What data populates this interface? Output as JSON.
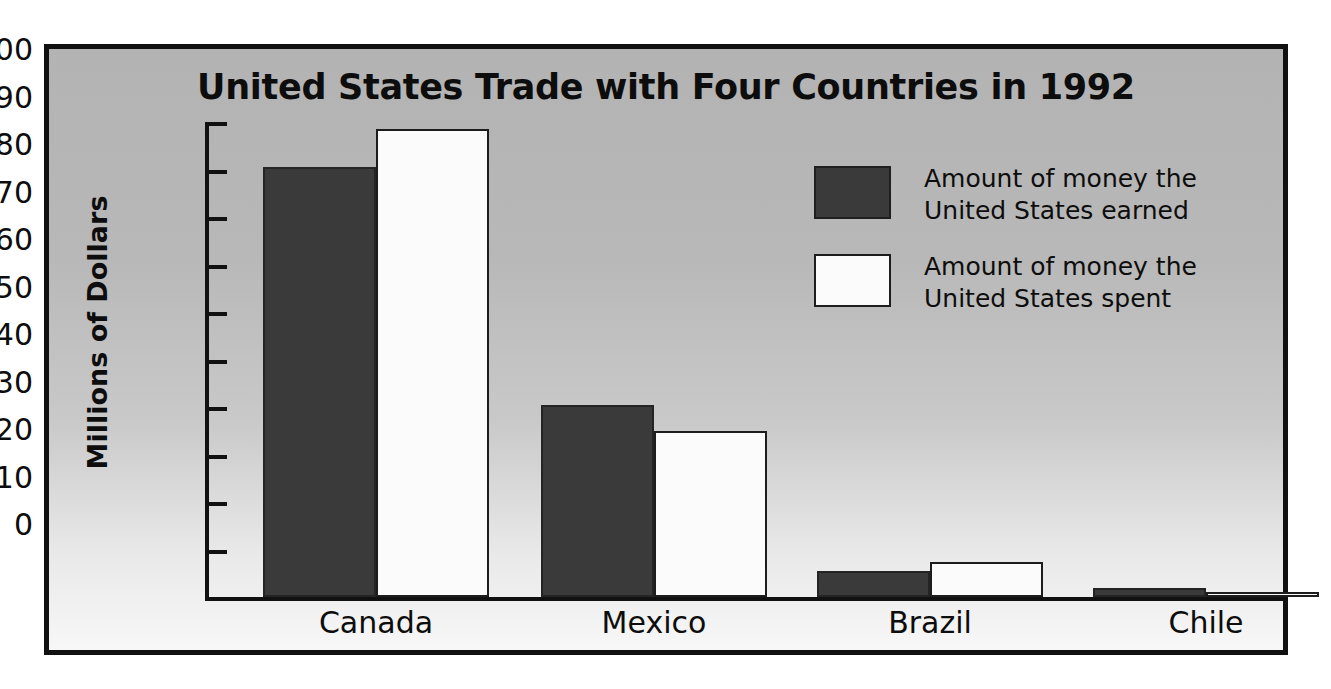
{
  "chart_data": {
    "type": "bar",
    "title": "United States Trade with Four Countries in 1992",
    "xlabel": "",
    "ylabel": "Millions of Dollars",
    "ylim": [
      0,
      100
    ],
    "ytick_values": [
      100,
      90,
      80,
      70,
      60,
      50,
      40,
      30,
      20,
      10,
      0
    ],
    "ytick_labels": [
      "100",
      "90",
      "80",
      "70",
      "60",
      "50",
      "40",
      "30",
      "20",
      "10",
      "0"
    ],
    "grid": false,
    "legend_position": "right-inside",
    "categories": [
      "Canada",
      "Mexico",
      "Brazil",
      "Chile"
    ],
    "series": [
      {
        "name": "Amount of money the United States earned",
        "legend_line1": "Amount of money the",
        "legend_line2": "United States earned",
        "color": "#3a3a3a",
        "values": [
          90.5,
          40.5,
          5.5,
          2.0
        ]
      },
      {
        "name": "Amount of money the United States spent",
        "legend_line1": "Amount of money the",
        "legend_line2": "United States spent",
        "color": "#fbfbfb",
        "values": [
          98.5,
          35.0,
          7.3,
          1.0
        ]
      }
    ]
  },
  "figure": {
    "background_top": "#b3b3b3",
    "background_bottom": "#f7f7f7",
    "border_color": "#111111",
    "axis_color": "#111111",
    "text_color": "#0d0d0d"
  }
}
